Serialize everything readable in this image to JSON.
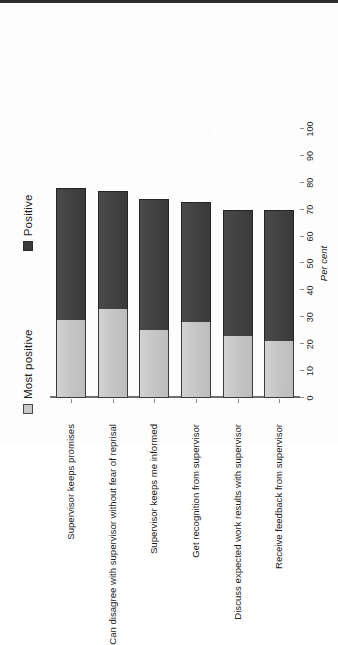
{
  "chart_data": {
    "type": "bar",
    "orientation": "horizontal",
    "title": "",
    "xlabel": "Per cent",
    "ylabel": "",
    "xlim": [
      0,
      100
    ],
    "grid": false,
    "legend_position": "top-left",
    "tick_labels": [
      "0",
      "10",
      "20",
      "30",
      "40",
      "50",
      "60",
      "70",
      "80",
      "90",
      "100"
    ],
    "categories": [
      "Supervisor keeps promises",
      "Can disagree with supervisor without fear of reprisal",
      "Supervisor keeps me informed",
      "Get recognition from supervisor",
      "Discuss expected work results with supervisor",
      "Receive feedback from supervisor"
    ],
    "series": [
      {
        "name": "Most positive",
        "color": "#c9c9c9",
        "values": [
          29,
          33,
          25,
          28,
          23,
          21
        ]
      },
      {
        "name": "Positive",
        "color": "#3a3a3a",
        "values": [
          49,
          44,
          49,
          45,
          47,
          49
        ]
      }
    ],
    "totals": [
      78,
      77,
      74,
      73,
      70,
      70
    ],
    "stacked": true
  },
  "legend": {
    "items": [
      {
        "label": "Most positive",
        "swatch": "light-square-swatch"
      },
      {
        "label": "Positive",
        "swatch": "dark-square-swatch"
      }
    ]
  },
  "axis": {
    "title": "Per cent"
  }
}
